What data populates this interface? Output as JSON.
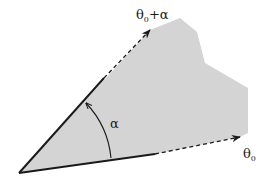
{
  "diagram": {
    "type": "angular-sector",
    "colors": {
      "region_fill": "#d4d4d4",
      "stroke": "#1a1a1a",
      "background": "#ffffff"
    },
    "labels": {
      "upper_ray_base": "θ",
      "upper_ray_sub": "0",
      "upper_ray_suffix": "+α",
      "lower_ray_base": "θ",
      "lower_ray_sub": "0",
      "angle": "α"
    },
    "geometry": {
      "apex": [
        19,
        173
      ],
      "upper_ray_solid_end": [
        104,
        78
      ],
      "upper_ray_arrow_tip": [
        150,
        30
      ],
      "lower_ray_solid_end": [
        155,
        154
      ],
      "lower_ray_arrow_tip": [
        240,
        137
      ],
      "region_polygon": [
        [
          19,
          173
        ],
        [
          150,
          30
        ],
        [
          180,
          18
        ],
        [
          197,
          32
        ],
        [
          205,
          63
        ],
        [
          248,
          88
        ],
        [
          248,
          133
        ],
        [
          240,
          137
        ],
        [
          155,
          154
        ]
      ]
    }
  }
}
